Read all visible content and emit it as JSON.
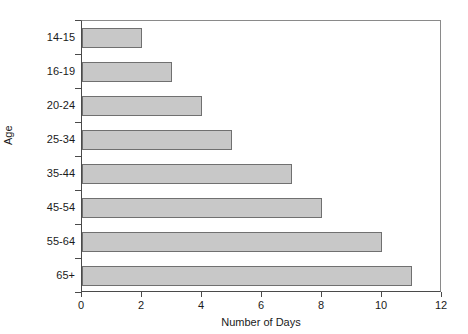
{
  "chart_data": {
    "type": "bar",
    "orientation": "horizontal",
    "title": "",
    "xlabel": "Number of Days",
    "ylabel": "Age",
    "categories": [
      "14-15",
      "16-19",
      "20-24",
      "25-34",
      "35-44",
      "45-54",
      "55-64",
      "65+"
    ],
    "values": [
      2,
      3,
      4,
      5,
      7,
      8,
      10,
      11
    ],
    "xlim": [
      0,
      12
    ],
    "xticks": [
      0,
      2,
      4,
      6,
      8,
      10,
      12
    ],
    "xtick_labels": [
      "0",
      "2",
      "4",
      "6",
      "8",
      "10",
      "12"
    ],
    "grid": false,
    "legend": null,
    "bar_color": "#c8c8c8",
    "bar_border_color": "#707070",
    "axis_color": "#4a4a4a",
    "background_color": "#ffffff"
  }
}
